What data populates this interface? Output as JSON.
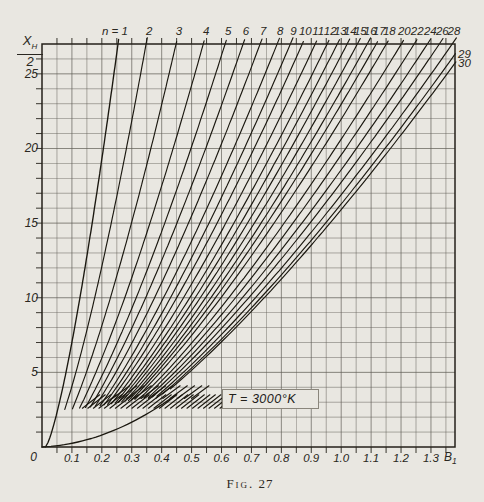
{
  "figure": {
    "caption_prefix": "Fig.",
    "caption_number": "27",
    "annotation": "T = 3000°K",
    "param_prefix": "n ="
  },
  "axes": {
    "y_label_numerator": "X",
    "y_label_numerator_sub": "H",
    "y_label_denominator": "2",
    "x_label": "B",
    "x_label_sub": "1",
    "origin_label": "0",
    "x_tick_labels": [
      "0.1",
      "0.2",
      "0.3",
      "0.4",
      "0.5",
      "0.6",
      "0.7",
      "0.8",
      "0.9",
      "1.0",
      "1.1",
      "1.2",
      "1.3"
    ],
    "x_tick_values": [
      0.1,
      0.2,
      0.3,
      0.4,
      0.5,
      0.6,
      0.7,
      0.8,
      0.9,
      1.0,
      1.1,
      1.2,
      1.3
    ],
    "y_tick_labels": [
      "25",
      "20",
      "15",
      "10",
      "5"
    ],
    "y_tick_values": [
      25,
      20,
      15,
      10,
      5
    ]
  },
  "chart_data": {
    "type": "line",
    "title": "Fig. 27",
    "xlabel": "B1",
    "ylabel": "X_H/2",
    "xlim": [
      0,
      1.381
    ],
    "ylim": [
      0,
      27
    ],
    "grid": "minor grid: 0.05 in x, 1 in y; full frame; ticks outside frame",
    "temperature_label": "T = 3000°K",
    "legend_position": "labels along top frame and right edge",
    "series": [
      {
        "n": "1",
        "x_at_top": 0.254
      },
      {
        "n": "2",
        "x_at_top": 0.348
      },
      {
        "n": "3",
        "x_at_top": 0.448
      },
      {
        "n": "4",
        "x_at_top": 0.539
      },
      {
        "n": "5",
        "x_at_top": 0.612
      },
      {
        "n": "6",
        "x_at_top": 0.672
      },
      {
        "n": "7",
        "x_at_top": 0.729
      },
      {
        "n": "8",
        "x_at_top": 0.786
      },
      {
        "n": "9",
        "x_at_top": 0.83
      },
      {
        "n": "10",
        "x_at_top": 0.87
      },
      {
        "n": "11",
        "x_at_top": 0.913
      },
      {
        "n": "12",
        "x_at_top": 0.953
      },
      {
        "n": "13",
        "x_at_top": 0.987
      },
      {
        "n": "14",
        "x_at_top": 1.02
      },
      {
        "n": "15",
        "x_at_top": 1.054
      },
      {
        "n": "16",
        "x_at_top": 1.087
      },
      {
        "n": "17",
        "x_at_top": 1.117
      },
      {
        "n": "18",
        "x_at_top": 1.151
      },
      {
        "n": "20",
        "x_at_top": 1.201
      },
      {
        "n": "22",
        "x_at_top": 1.244
      },
      {
        "n": "24",
        "x_at_top": 1.288
      },
      {
        "n": "26",
        "x_at_top": 1.328
      },
      {
        "n": "28",
        "x_at_top": 1.371
      },
      {
        "n": "29",
        "x_at_top": 1.405,
        "exits_right_edge": true
      },
      {
        "n": "30",
        "x_at_top": 1.427,
        "exits_right_edge": true
      }
    ],
    "base_curve_points": [
      [
        0,
        0
      ],
      [
        0.1,
        0.25
      ],
      [
        0.2,
        0.8
      ],
      [
        0.3,
        1.66
      ],
      [
        0.4,
        2.9
      ],
      [
        0.45,
        3.54
      ]
    ],
    "density_hatch": [
      {
        "x_start": 0.135,
        "x_end": 0.595,
        "y_low": 2.6,
        "y_high": 3.5,
        "count": 26
      },
      {
        "x_start": 0.235,
        "x_end": 0.5,
        "y_low": 3.25,
        "y_high": 4.1,
        "count": 12
      }
    ]
  },
  "style": {
    "paper_color": "#e9e7e1",
    "grid_color": "#5f5c55",
    "frame_color": "#24211a",
    "curve_color": "#1b1810",
    "text_color": "#2a2721"
  }
}
